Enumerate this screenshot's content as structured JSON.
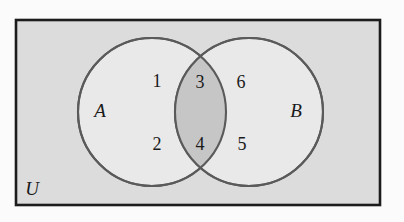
{
  "diagram": {
    "kind": "venn-diagram-two-sets",
    "title_visible": false,
    "universe": {
      "label": "U",
      "label_position": "bottom-left-inside",
      "fill_color": "#dcdcdc",
      "border_color": "#1c1c1c"
    },
    "sets": [
      {
        "id": "A",
        "label": "A",
        "label_position": "left-inside",
        "fill_color": "#e9e9e9",
        "stroke_color": "#5a5a5a"
      },
      {
        "id": "B",
        "label": "B",
        "label_position": "right-inside",
        "fill_color": "#e9e9e9",
        "stroke_color": "#5a5a5a"
      }
    ],
    "intersection": {
      "label": "A intersect B",
      "fill_color": "#c6c6c6",
      "shaded": true
    },
    "regions": [
      {
        "id": "a-only-top",
        "value": "1",
        "belongs_to": "A only"
      },
      {
        "id": "a-only-bottom",
        "value": "2",
        "belongs_to": "A only"
      },
      {
        "id": "intersection-top",
        "value": "3",
        "belongs_to": "A and B"
      },
      {
        "id": "intersection-bottom",
        "value": "4",
        "belongs_to": "A and B"
      },
      {
        "id": "b-only-bottom",
        "value": "5",
        "belongs_to": "B only"
      },
      {
        "id": "b-only-top",
        "value": "6",
        "belongs_to": "B only"
      }
    ],
    "colors": {
      "page_background": "#fbfbfb",
      "universe_fill": "#dcdcdc",
      "circle_fill": "#e9e9e9",
      "lens_fill": "#c6c6c6",
      "circle_stroke": "#5a5a5a",
      "rect_stroke": "#1c1c1c",
      "text": "#1a1a1a"
    }
  }
}
